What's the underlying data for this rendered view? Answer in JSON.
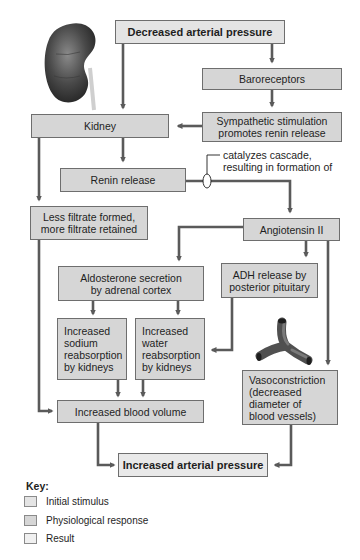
{
  "diagram": {
    "nodes": {
      "decreased_pressure": {
        "label": "Decreased arterial pressure",
        "type": "initial"
      },
      "baroreceptors": {
        "label": "Baroreceptors",
        "type": "response"
      },
      "sympathetic": {
        "label": "Sympathetic stimulation\npromotes renin release",
        "type": "response"
      },
      "kidney": {
        "label": "Kidney",
        "type": "response"
      },
      "renin": {
        "label": "Renin release",
        "type": "response"
      },
      "less_filtrate": {
        "label": "Less filtrate formed,\nmore filtrate retained",
        "type": "response"
      },
      "angiotensin": {
        "label": "Angiotensin II",
        "type": "response"
      },
      "aldosterone": {
        "label": "Aldosterone secretion\nby adrenal cortex",
        "type": "response"
      },
      "adh": {
        "label": "ADH release by\nposterior pituitary",
        "type": "response"
      },
      "sodium": {
        "label": "Increased\nsodium\nreabsorption\nby kidneys",
        "type": "response"
      },
      "water": {
        "label": "Increased\nwater\nreabsorption\nby kidneys",
        "type": "response"
      },
      "vasoconstriction": {
        "label": "Vasoconstriction\n(decreased\ndiameter of\nblood vessels)",
        "type": "response"
      },
      "blood_volume": {
        "label": "Increased blood volume",
        "type": "response"
      },
      "increased_pressure": {
        "label": "Increased arterial pressure",
        "type": "result"
      }
    },
    "annotation": "catalyzes cascade,\nresulting in formation of",
    "edges": [
      [
        "decreased_pressure",
        "kidney"
      ],
      [
        "decreased_pressure",
        "baroreceptors"
      ],
      [
        "baroreceptors",
        "sympathetic"
      ],
      [
        "sympathetic",
        "kidney"
      ],
      [
        "kidney",
        "renin"
      ],
      [
        "kidney",
        "less_filtrate"
      ],
      [
        "renin",
        "angiotensin"
      ],
      [
        "angiotensin",
        "aldosterone"
      ],
      [
        "angiotensin",
        "adh"
      ],
      [
        "angiotensin",
        "vasoconstriction"
      ],
      [
        "aldosterone",
        "sodium"
      ],
      [
        "aldosterone",
        "water"
      ],
      [
        "adh",
        "water"
      ],
      [
        "sodium",
        "blood_volume"
      ],
      [
        "water",
        "blood_volume"
      ],
      [
        "less_filtrate",
        "blood_volume"
      ],
      [
        "blood_volume",
        "increased_pressure"
      ],
      [
        "vasoconstriction",
        "increased_pressure"
      ]
    ],
    "illustrations": [
      "kidney-illustration",
      "blood-vessel-illustration"
    ]
  },
  "key": {
    "title": "Key:",
    "items": [
      {
        "label": "Initial stimulus",
        "color": "#e4e4e4"
      },
      {
        "label": "Physiological response",
        "color": "#d6d6d6"
      },
      {
        "label": "Result",
        "color": "#f0f0f0"
      }
    ]
  },
  "colors": {
    "arrow": "#5a5a5a",
    "box_border": "#6e6e6e"
  }
}
